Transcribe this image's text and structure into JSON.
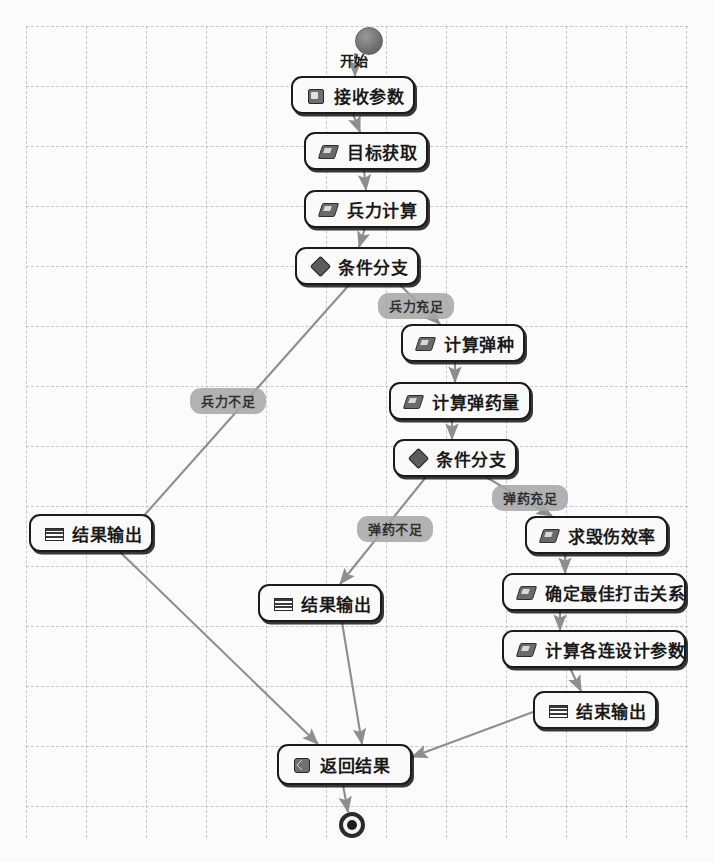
{
  "diagram": {
    "canvas": {
      "width": 714,
      "height": 862,
      "background": "#fbfbfb",
      "grid": true,
      "grid_color": "#b4b7c0",
      "grid_size": 60
    },
    "start": {
      "label": "开始",
      "x": 355,
      "y": 27,
      "shape": "filled-circle"
    },
    "end": {
      "label": "",
      "x": 339,
      "y": 812,
      "shape": "ring-circle"
    },
    "nodes": [
      {
        "id": "n1",
        "label": "接收参数",
        "icon": "receive-params-icon",
        "icon_type": "recv",
        "x": 291,
        "y": 76,
        "w": 124,
        "h": 38
      },
      {
        "id": "n2",
        "label": "目标获取",
        "icon": "gear-icon",
        "icon_type": "gear",
        "x": 304,
        "y": 132,
        "w": 124,
        "h": 38
      },
      {
        "id": "n3",
        "label": "兵力计算",
        "icon": "gear-icon",
        "icon_type": "gear",
        "x": 304,
        "y": 190,
        "w": 124,
        "h": 38
      },
      {
        "id": "n4",
        "label": "条件分支",
        "icon": "diamond-icon",
        "icon_type": "diamond",
        "x": 295,
        "y": 247,
        "w": 124,
        "h": 38
      },
      {
        "id": "n5",
        "label": "计算弹种",
        "icon": "gear-icon",
        "icon_type": "gear",
        "x": 401,
        "y": 324,
        "w": 124,
        "h": 38
      },
      {
        "id": "n6",
        "label": "计算弹药量",
        "icon": "gear-icon",
        "icon_type": "gear",
        "x": 389,
        "y": 382,
        "w": 142,
        "h": 38
      },
      {
        "id": "n7",
        "label": "条件分支",
        "icon": "diamond-icon",
        "icon_type": "diamond",
        "x": 393,
        "y": 439,
        "w": 124,
        "h": 38
      },
      {
        "id": "n8",
        "label": "结果输出",
        "icon": "output-list-icon",
        "icon_type": "list",
        "x": 29,
        "y": 514,
        "w": 124,
        "h": 38
      },
      {
        "id": "n9",
        "label": "求毁伤效率",
        "icon": "gear-icon",
        "icon_type": "gear",
        "x": 525,
        "y": 516,
        "w": 143,
        "h": 38
      },
      {
        "id": "n10",
        "label": "结果输出",
        "icon": "output-list-icon",
        "icon_type": "list",
        "x": 258,
        "y": 584,
        "w": 124,
        "h": 38
      },
      {
        "id": "n11",
        "label": "确定最佳打击关系",
        "icon": "gear-icon",
        "icon_type": "gear",
        "x": 502,
        "y": 573,
        "w": 184,
        "h": 38
      },
      {
        "id": "n12",
        "label": "计算各连设计参数",
        "icon": "gear-icon",
        "icon_type": "gear",
        "x": 502,
        "y": 630,
        "w": 184,
        "h": 38
      },
      {
        "id": "n13",
        "label": "结束输出",
        "icon": "output-list-icon",
        "icon_type": "list",
        "x": 533,
        "y": 691,
        "w": 124,
        "h": 38
      },
      {
        "id": "n14",
        "label": "返回结果",
        "icon": "return-icon",
        "icon_type": "return",
        "x": 277,
        "y": 744,
        "w": 135,
        "h": 41
      }
    ],
    "edge_labels": [
      {
        "id": "e_l1",
        "label": "兵力充足",
        "x": 378,
        "y": 293
      },
      {
        "id": "e_l2",
        "label": "兵力不足",
        "x": 190,
        "y": 388
      },
      {
        "id": "e_l3",
        "label": "弹药充足",
        "x": 492,
        "y": 485
      },
      {
        "id": "e_l4",
        "label": "弹药不足",
        "x": 357,
        "y": 516
      }
    ],
    "edges": [
      {
        "from": "start",
        "to": "n1",
        "d": "M 355,53 L 355,76"
      },
      {
        "from": "n1",
        "to": "n2",
        "d": "M 353,114 L 360,132"
      },
      {
        "from": "n2",
        "to": "n3",
        "d": "M 364,170 L 366,190"
      },
      {
        "from": "n3",
        "to": "n4",
        "d": "M 365,228 L 359,247"
      },
      {
        "from": "n4",
        "to": "n5",
        "d": "M 400,285 L 440,324"
      },
      {
        "from": "n4",
        "to": "n8",
        "d": "M 349,285 L 125,537"
      },
      {
        "from": "n5",
        "to": "n6",
        "d": "M 455,362 L 455,382"
      },
      {
        "from": "n6",
        "to": "n7",
        "d": "M 452,420 L 452,439"
      },
      {
        "from": "n7",
        "to": "n9",
        "d": "M 486,477 L 552,516"
      },
      {
        "from": "n7",
        "to": "n10",
        "d": "M 426,477 L 340,584"
      },
      {
        "from": "n9",
        "to": "n11",
        "d": "M 565,554 L 565,573"
      },
      {
        "from": "n11",
        "to": "n12",
        "d": "M 560,611 L 560,630"
      },
      {
        "from": "n12",
        "to": "n13",
        "d": "M 570,668 L 581,691"
      },
      {
        "from": "n8",
        "to": "n14",
        "d": "M 120,552 L 318,744"
      },
      {
        "from": "n10",
        "to": "n14",
        "d": "M 342,622 L 362,744"
      },
      {
        "from": "n13",
        "to": "n14",
        "d": "M 533,712 L 412,757"
      },
      {
        "from": "n14",
        "to": "end",
        "d": "M 343,785 L 348,812"
      }
    ],
    "style": {
      "node_border": "#1b1b1b",
      "node_fill": "#fafafa",
      "edge_color": "#8e8e8e",
      "label_fill": "#a8a8a8"
    }
  }
}
